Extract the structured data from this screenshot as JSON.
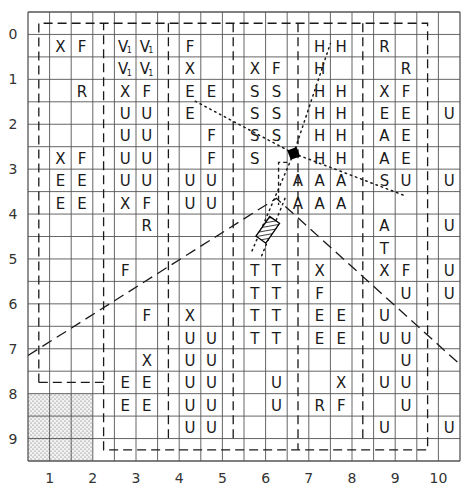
{
  "diagram": {
    "grid_cols": 20,
    "grid_rows": 20,
    "row_labels": [
      "0",
      "1",
      "2",
      "3",
      "4",
      "5",
      "6",
      "7",
      "8",
      "9"
    ],
    "col_labels": [
      "1",
      "2",
      "3",
      "4",
      "5",
      "6",
      "7",
      "8",
      "9",
      "10"
    ],
    "colors": {
      "line": "#555555",
      "text": "#1a1a1a",
      "dashed": "#1a1a1a"
    },
    "shaded_zone": {
      "col_start": 0,
      "col_end": 3,
      "row_start": 17,
      "row_end": 20,
      "pattern": "dotted"
    },
    "cells": [
      {
        "r": 1,
        "c": 1,
        "t": "X"
      },
      {
        "r": 1,
        "c": 2,
        "t": "F"
      },
      {
        "r": 1,
        "c": 4,
        "t": "V",
        "sub": "1"
      },
      {
        "r": 1,
        "c": 5,
        "t": "V",
        "sub": "1"
      },
      {
        "r": 1,
        "c": 7,
        "t": "F"
      },
      {
        "r": 1,
        "c": 13,
        "t": "H"
      },
      {
        "r": 1,
        "c": 14,
        "t": "H"
      },
      {
        "r": 1,
        "c": 16,
        "t": "R"
      },
      {
        "r": 2,
        "c": 4,
        "t": "V",
        "sub": "1"
      },
      {
        "r": 2,
        "c": 5,
        "t": "V",
        "sub": "1"
      },
      {
        "r": 2,
        "c": 7,
        "t": "X"
      },
      {
        "r": 2,
        "c": 10,
        "t": "X"
      },
      {
        "r": 2,
        "c": 11,
        "t": "F"
      },
      {
        "r": 2,
        "c": 13,
        "t": "H"
      },
      {
        "r": 2,
        "c": 17,
        "t": "R"
      },
      {
        "r": 3,
        "c": 2,
        "t": "R"
      },
      {
        "r": 3,
        "c": 4,
        "t": "X"
      },
      {
        "r": 3,
        "c": 5,
        "t": "F"
      },
      {
        "r": 3,
        "c": 7,
        "t": "E"
      },
      {
        "r": 3,
        "c": 8,
        "t": "E"
      },
      {
        "r": 3,
        "c": 10,
        "t": "S"
      },
      {
        "r": 3,
        "c": 11,
        "t": "S"
      },
      {
        "r": 3,
        "c": 13,
        "t": "H"
      },
      {
        "r": 3,
        "c": 14,
        "t": "H"
      },
      {
        "r": 3,
        "c": 16,
        "t": "X"
      },
      {
        "r": 3,
        "c": 17,
        "t": "F"
      },
      {
        "r": 4,
        "c": 4,
        "t": "U"
      },
      {
        "r": 4,
        "c": 5,
        "t": "U"
      },
      {
        "r": 4,
        "c": 7,
        "t": "E"
      },
      {
        "r": 4,
        "c": 10,
        "t": "S"
      },
      {
        "r": 4,
        "c": 11,
        "t": "S"
      },
      {
        "r": 4,
        "c": 13,
        "t": "H"
      },
      {
        "r": 4,
        "c": 14,
        "t": "H"
      },
      {
        "r": 4,
        "c": 16,
        "t": "E"
      },
      {
        "r": 4,
        "c": 17,
        "t": "E"
      },
      {
        "r": 4,
        "c": 19,
        "t": "U"
      },
      {
        "r": 5,
        "c": 4,
        "t": "U"
      },
      {
        "r": 5,
        "c": 5,
        "t": "U"
      },
      {
        "r": 5,
        "c": 8,
        "t": "F"
      },
      {
        "r": 5,
        "c": 10,
        "t": "S"
      },
      {
        "r": 5,
        "c": 11,
        "t": "S"
      },
      {
        "r": 5,
        "c": 13,
        "t": "H"
      },
      {
        "r": 5,
        "c": 14,
        "t": "H"
      },
      {
        "r": 5,
        "c": 16,
        "t": "A"
      },
      {
        "r": 5,
        "c": 17,
        "t": "E"
      },
      {
        "r": 6,
        "c": 1,
        "t": "X"
      },
      {
        "r": 6,
        "c": 2,
        "t": "F"
      },
      {
        "r": 6,
        "c": 4,
        "t": "U"
      },
      {
        "r": 6,
        "c": 5,
        "t": "U"
      },
      {
        "r": 6,
        "c": 8,
        "t": "F"
      },
      {
        "r": 6,
        "c": 10,
        "t": "S"
      },
      {
        "r": 6,
        "c": 13,
        "t": "H"
      },
      {
        "r": 6,
        "c": 14,
        "t": "H"
      },
      {
        "r": 6,
        "c": 16,
        "t": "A"
      },
      {
        "r": 6,
        "c": 17,
        "t": "E"
      },
      {
        "r": 7,
        "c": 1,
        "t": "E"
      },
      {
        "r": 7,
        "c": 2,
        "t": "E"
      },
      {
        "r": 7,
        "c": 4,
        "t": "U"
      },
      {
        "r": 7,
        "c": 5,
        "t": "U"
      },
      {
        "r": 7,
        "c": 7,
        "t": "U"
      },
      {
        "r": 7,
        "c": 8,
        "t": "U"
      },
      {
        "r": 7,
        "c": 12,
        "t": "A"
      },
      {
        "r": 7,
        "c": 13,
        "t": "A"
      },
      {
        "r": 7,
        "c": 14,
        "t": "A"
      },
      {
        "r": 7,
        "c": 16,
        "t": "S"
      },
      {
        "r": 7,
        "c": 17,
        "t": "U"
      },
      {
        "r": 7,
        "c": 19,
        "t": "U"
      },
      {
        "r": 8,
        "c": 1,
        "t": "E"
      },
      {
        "r": 8,
        "c": 2,
        "t": "E"
      },
      {
        "r": 8,
        "c": 4,
        "t": "X"
      },
      {
        "r": 8,
        "c": 5,
        "t": "F"
      },
      {
        "r": 8,
        "c": 7,
        "t": "U"
      },
      {
        "r": 8,
        "c": 8,
        "t": "U"
      },
      {
        "r": 8,
        "c": 12,
        "t": "A"
      },
      {
        "r": 8,
        "c": 13,
        "t": "A"
      },
      {
        "r": 8,
        "c": 14,
        "t": "A"
      },
      {
        "r": 9,
        "c": 5,
        "t": "R"
      },
      {
        "r": 9,
        "c": 16,
        "t": "A"
      },
      {
        "r": 9,
        "c": 19,
        "t": "U"
      },
      {
        "r": 10,
        "c": 16,
        "t": "T"
      },
      {
        "r": 11,
        "c": 4,
        "t": "F"
      },
      {
        "r": 11,
        "c": 10,
        "t": "T"
      },
      {
        "r": 11,
        "c": 11,
        "t": "T"
      },
      {
        "r": 11,
        "c": 13,
        "t": "X"
      },
      {
        "r": 11,
        "c": 16,
        "t": "X"
      },
      {
        "r": 11,
        "c": 17,
        "t": "F"
      },
      {
        "r": 11,
        "c": 19,
        "t": "U"
      },
      {
        "r": 12,
        "c": 10,
        "t": "T"
      },
      {
        "r": 12,
        "c": 11,
        "t": "T"
      },
      {
        "r": 12,
        "c": 13,
        "t": "F"
      },
      {
        "r": 12,
        "c": 17,
        "t": "U"
      },
      {
        "r": 12,
        "c": 19,
        "t": "U"
      },
      {
        "r": 13,
        "c": 5,
        "t": "F"
      },
      {
        "r": 13,
        "c": 7,
        "t": "X"
      },
      {
        "r": 13,
        "c": 10,
        "t": "T"
      },
      {
        "r": 13,
        "c": 11,
        "t": "T"
      },
      {
        "r": 13,
        "c": 13,
        "t": "E"
      },
      {
        "r": 13,
        "c": 14,
        "t": "E"
      },
      {
        "r": 13,
        "c": 16,
        "t": "U"
      },
      {
        "r": 14,
        "c": 7,
        "t": "U"
      },
      {
        "r": 14,
        "c": 8,
        "t": "U"
      },
      {
        "r": 14,
        "c": 10,
        "t": "T"
      },
      {
        "r": 14,
        "c": 11,
        "t": "T"
      },
      {
        "r": 14,
        "c": 13,
        "t": "E"
      },
      {
        "r": 14,
        "c": 14,
        "t": "E"
      },
      {
        "r": 14,
        "c": 16,
        "t": "U"
      },
      {
        "r": 14,
        "c": 17,
        "t": "U"
      },
      {
        "r": 15,
        "c": 5,
        "t": "X"
      },
      {
        "r": 15,
        "c": 7,
        "t": "U"
      },
      {
        "r": 15,
        "c": 8,
        "t": "U"
      },
      {
        "r": 15,
        "c": 17,
        "t": "U"
      },
      {
        "r": 16,
        "c": 4,
        "t": "E"
      },
      {
        "r": 16,
        "c": 5,
        "t": "E"
      },
      {
        "r": 16,
        "c": 7,
        "t": "U"
      },
      {
        "r": 16,
        "c": 8,
        "t": "U"
      },
      {
        "r": 16,
        "c": 11,
        "t": "U"
      },
      {
        "r": 16,
        "c": 14,
        "t": "X"
      },
      {
        "r": 16,
        "c": 16,
        "t": "U"
      },
      {
        "r": 16,
        "c": 17,
        "t": "U"
      },
      {
        "r": 17,
        "c": 4,
        "t": "E"
      },
      {
        "r": 17,
        "c": 5,
        "t": "E"
      },
      {
        "r": 17,
        "c": 7,
        "t": "U"
      },
      {
        "r": 17,
        "c": 8,
        "t": "U"
      },
      {
        "r": 17,
        "c": 11,
        "t": "U"
      },
      {
        "r": 17,
        "c": 13,
        "t": "R"
      },
      {
        "r": 17,
        "c": 14,
        "t": "F"
      },
      {
        "r": 17,
        "c": 17,
        "t": "U"
      },
      {
        "r": 18,
        "c": 7,
        "t": "U"
      },
      {
        "r": 18,
        "c": 8,
        "t": "U"
      },
      {
        "r": 18,
        "c": 16,
        "t": "U"
      },
      {
        "r": 18,
        "c": 19,
        "t": "U"
      }
    ],
    "markers": {
      "black_square": "filled-square-marker",
      "hatched_box": "hatched-rectangle-marker"
    }
  }
}
